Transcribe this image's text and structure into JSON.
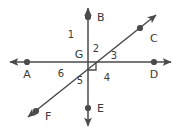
{
  "figure": {
    "kind": "geometry-diagram",
    "stroke_color": "#4a4a4a",
    "text_color": "#3a3a3a",
    "background_color": "#ffffff",
    "vertex": {
      "label": "G",
      "x": 88,
      "y": 62
    },
    "lines": [
      {
        "name": "horizontal-line",
        "endpoints_labels": [
          "A",
          "D"
        ],
        "x1": 6,
        "y1": 62,
        "x2": 175,
        "y2": 62,
        "arrows": "both"
      },
      {
        "name": "vertical-line",
        "endpoints_labels": [
          "B",
          "E"
        ],
        "x1": 88,
        "y1": 4,
        "x2": 88,
        "y2": 130,
        "arrows": "both"
      },
      {
        "name": "diagonal-line",
        "endpoints_labels": [
          "F",
          "C"
        ],
        "x1": 24,
        "y1": 120,
        "x2": 160,
        "y2": 12,
        "arrows": "both"
      }
    ],
    "points": [
      {
        "label": "A",
        "cx": 27,
        "cy": 62,
        "lx": 27,
        "ly": 78,
        "anchor": "middle"
      },
      {
        "label": "B",
        "cx": 88,
        "cy": 17,
        "lx": 97,
        "ly": 21,
        "anchor": "start"
      },
      {
        "label": "C",
        "cx": 140,
        "cy": 28,
        "lx": 150,
        "ly": 42,
        "anchor": "start"
      },
      {
        "label": "D",
        "cx": 154,
        "cy": 62,
        "lx": 154,
        "ly": 78,
        "anchor": "middle"
      },
      {
        "label": "E",
        "cx": 88,
        "cy": 108,
        "lx": 97,
        "ly": 112,
        "anchor": "start"
      },
      {
        "label": "F",
        "cx": 36,
        "cy": 111,
        "lx": 45,
        "ly": 120,
        "anchor": "start"
      }
    ],
    "angles": [
      {
        "label": "1",
        "x": 71,
        "y": 35
      },
      {
        "label": "2",
        "x": 95,
        "y": 48
      },
      {
        "label": "3",
        "x": 113,
        "y": 59
      },
      {
        "label": "4",
        "x": 107,
        "y": 79
      },
      {
        "label": "5",
        "x": 81,
        "y": 83
      },
      {
        "label": "6",
        "x": 61,
        "y": 76
      }
    ],
    "right_angle_mark": {
      "name": "right-angle-marker",
      "points": "88,68 96,68 96,76",
      "x": 88,
      "y": 62
    }
  }
}
